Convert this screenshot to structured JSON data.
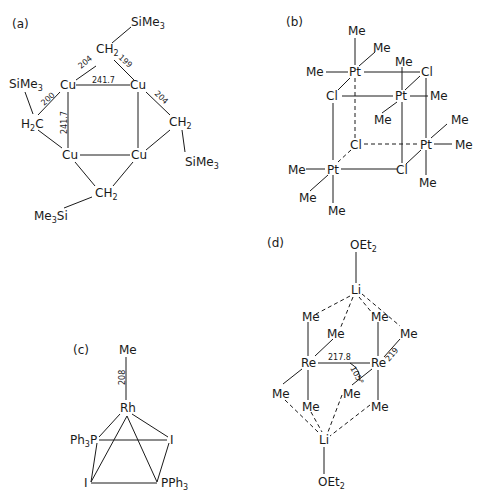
{
  "figure": {
    "panels": [
      {
        "id": "a",
        "label": "(a)",
        "title": "Cu4(CH2SiMe3)4",
        "atoms": {
          "cu": "Cu",
          "ch2": "CH2",
          "h2c": "H2C",
          "sime3": "SiMe3",
          "me3si": "Me3Si"
        },
        "bond_lengths": {
          "cu_cu_top": "241.7",
          "cu_cu_left": "241.7",
          "cu_c_top_left": "204",
          "cu_c_top_right": "199",
          "cu_c_left": "200",
          "cu_c_right": "204"
        }
      },
      {
        "id": "b",
        "label": "(b)",
        "title": "[PtMe3Cl]4",
        "atoms": {
          "pt": "Pt",
          "cl": "Cl",
          "me": "Me"
        }
      },
      {
        "id": "c",
        "label": "(c)",
        "title": "RhMeI2(PPh3)2",
        "atoms": {
          "rh": "Rh",
          "me": "Me",
          "i": "I",
          "ph3p": "Ph3P",
          "pph3": "PPh3"
        },
        "bond_lengths": {
          "rh_me": "208"
        }
      },
      {
        "id": "d",
        "label": "(d)",
        "title": "[Li(OEt2)]2[Re2Me8]",
        "atoms": {
          "li": "Li",
          "re": "Re",
          "me": "Me",
          "oet2": "OEt2"
        },
        "bond_lengths": {
          "re_re": "217.8",
          "re_me": "219"
        },
        "angles": {
          "re_re_me": "105°"
        }
      }
    ]
  }
}
